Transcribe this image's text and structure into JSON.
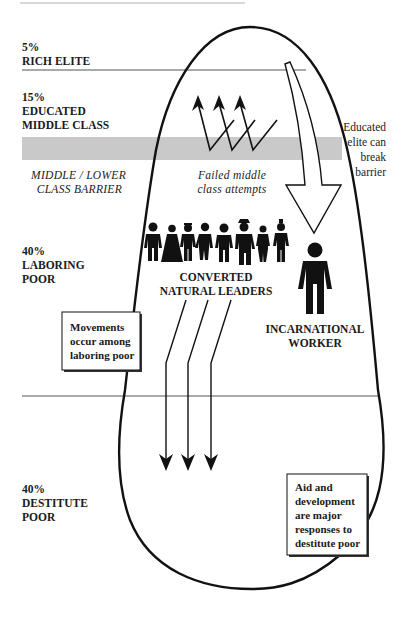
{
  "colors": {
    "ink": "#111111",
    "barrier_band": "#c9c9c9",
    "divider": "#555555",
    "background": "#ffffff"
  },
  "strata": [
    {
      "id": "rich-elite",
      "percent": "5%",
      "line1": "RICH ELITE",
      "line2": ""
    },
    {
      "id": "educated-middle-class",
      "percent": "15%",
      "line1": "EDUCATED",
      "line2": "MIDDLE CLASS"
    },
    {
      "id": "laboring-poor",
      "percent": "40%",
      "line1": "LABORING",
      "line2": "POOR"
    },
    {
      "id": "destitute-poor",
      "percent": "40%",
      "line1": "DESTITUTE",
      "line2": "POOR"
    }
  ],
  "barrier": {
    "label_line1": "MIDDLE / LOWER",
    "label_line2": "CLASS BARRIER"
  },
  "failed_attempts": {
    "line1": "Failed middle",
    "line2": "class attempts"
  },
  "educated_elite_note": {
    "line1": "Educated",
    "line2": "elite can",
    "line3": "break",
    "line4": "barrier"
  },
  "converted_leaders": {
    "line1": "CONVERTED",
    "line2": "NATURAL LEADERS",
    "figure_count": 8
  },
  "incarnational_worker": {
    "line1": "INCARNATIONAL",
    "line2": "WORKER"
  },
  "movements_box": {
    "line1": "Movements",
    "line2": "occur among",
    "line3": "laboring poor"
  },
  "aid_box": {
    "line1": "Aid and",
    "line2": "development",
    "line3": "are major",
    "line4": "responses to",
    "line5": "destitute poor"
  }
}
